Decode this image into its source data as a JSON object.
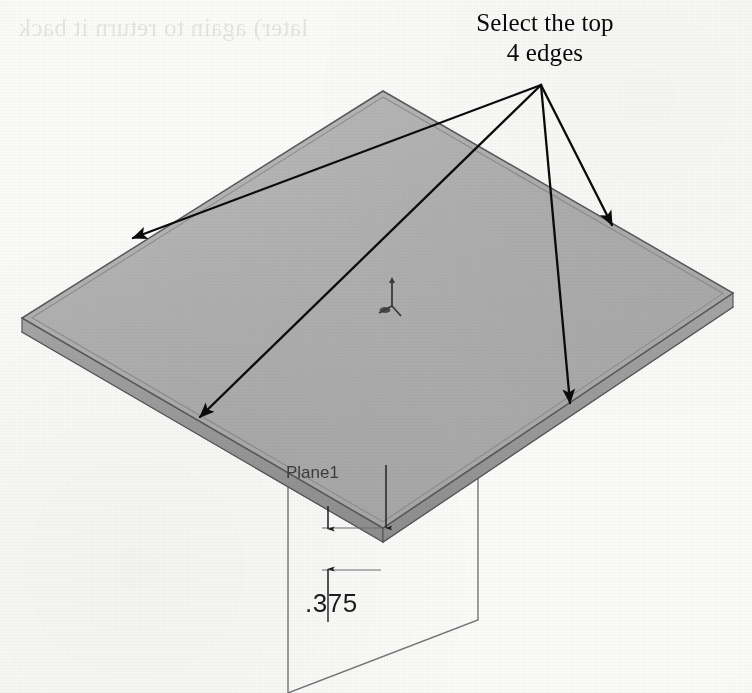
{
  "page": {
    "background_color": "#fbfbfa",
    "width": 752,
    "height": 693,
    "bleed_through_text": "later) again to return it back"
  },
  "callout": {
    "text": "Select the top\n4 edges",
    "line1": "Select the top",
    "line2": "4 edges",
    "color": "#0a0a0a",
    "leader_origin": {
      "x": 541,
      "y": 85
    },
    "arrow_count": 4,
    "arrow_targets": [
      {
        "name": "upper-left-edge",
        "x": 133,
        "y": 238
      },
      {
        "name": "lower-left-edge",
        "x": 200,
        "y": 417
      },
      {
        "name": "upper-right-edge",
        "x": 612,
        "y": 225
      },
      {
        "name": "lower-right-edge",
        "x": 570,
        "y": 403
      }
    ]
  },
  "model": {
    "name": "plate",
    "face_color": "#b2b2b2",
    "side_color": "#9a9a9a",
    "edge_color": "#5a5a5a",
    "top_face": [
      {
        "x": 383,
        "y": 91
      },
      {
        "x": 733,
        "y": 293
      },
      {
        "x": 383,
        "y": 528
      },
      {
        "x": 22,
        "y": 318
      }
    ],
    "thickness_offset_y": 14
  },
  "plane": {
    "label": "Plane1",
    "label_color": "#3d3d3d",
    "label_pos": {
      "x": 286,
      "y": 478
    },
    "outline_color": "#737373",
    "corners": [
      {
        "x": 288,
        "y": 465
      },
      {
        "x": 478,
        "y": 346
      },
      {
        "x": 478,
        "y": 620
      },
      {
        "x": 288,
        "y": 693
      }
    ]
  },
  "dimension": {
    "value": ".375",
    "text_color": "#1c1c1c",
    "text_pos": {
      "x": 305,
      "y": 612
    },
    "line_color": "#1c1c1c",
    "witness_color": "#6e6e6e",
    "dim_line_x": 328,
    "dim_top_y": 528,
    "dim_bottom_y": 570,
    "leader_from": {
      "x": 386,
      "y": 465
    },
    "leader_to": {
      "x": 386,
      "y": 528
    }
  },
  "origin_triad": {
    "name": "origin",
    "color": "#3a3a3a",
    "pos": {
      "x": 392,
      "y": 300
    }
  }
}
